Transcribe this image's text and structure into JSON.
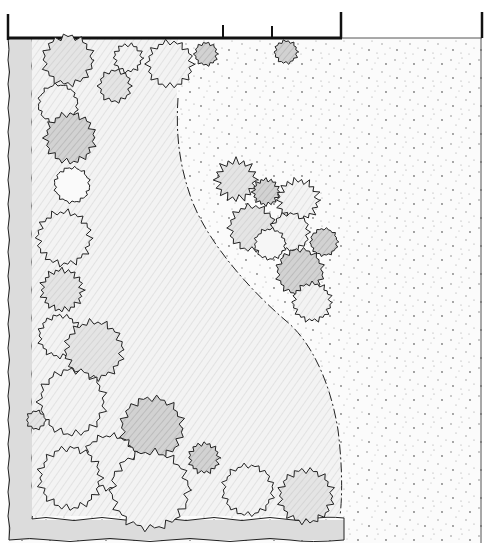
{
  "diagram": {
    "type": "landscape-site-plan",
    "style": "hand-drawn pencil sketch",
    "labels": [],
    "colors": {
      "background": "#ffffff",
      "ink": "#1e1e1e",
      "lawn_fill": "#f4f4f4",
      "border_fill": "#dcdcdc",
      "gravel_dot": "#8a8a8a",
      "shrub_light": "#ececec",
      "shrub_mid": "#d6d6d6",
      "shrub_dark": "#bdbdbd"
    },
    "elements": {
      "top_wall": "heavy boundary line with post tick marks",
      "left_border": "wavy-edged planting strip along left and bottom edges",
      "lawn": "open lawn area bounded by a curved dash-dot line",
      "gravel": "stippled gravel area on the right",
      "shrub_border": "clusters of scalloped shrub canopies along the left and bottom",
      "island_group": "cluster of shrubs in the gravel area",
      "specimen_trees": "two small shrubs near the top edge in the gravel"
    },
    "counts": {
      "border_shrubs": 20,
      "island_shrubs": 9,
      "specimen_shrubs": 2
    }
  }
}
